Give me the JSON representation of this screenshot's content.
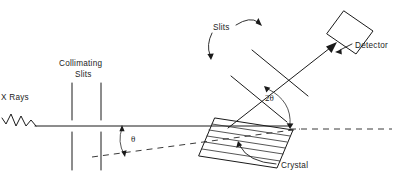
{
  "figure": {
    "background_color": "#ffffff",
    "line_color": "#1a1a1a"
  },
  "labels": {
    "x_rays": "X Rays",
    "collimating_slits_line1": "Collimating",
    "collimating_slits_line2": "Slits",
    "slits": "Slits",
    "detector": "Detector",
    "crystal": "Crystal",
    "theta": "θ",
    "two_theta": "2θ"
  },
  "icons": {
    "wave": "xray-wave-icon",
    "crystal": "hatched-crystal-icon",
    "detector": "detector-box-icon",
    "arrow": "arrowhead-icon"
  },
  "geometry": {
    "incident_beam_y": 126,
    "crystal_pivot": [
      288,
      129
    ],
    "crystal_face_origin": [
      215,
      118
    ],
    "theta_label_position": [
      131,
      139
    ],
    "two_theta_label_position": [
      272,
      98
    ]
  }
}
